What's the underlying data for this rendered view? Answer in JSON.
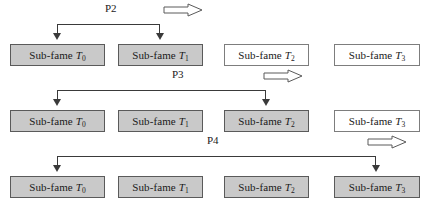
{
  "diagram": {
    "box_label_prefix": "Sub-fame",
    "colors": {
      "shaded_fill": "#c9c9c9",
      "plain_fill": "#ffffff",
      "border": "#4a4a4a",
      "line": "#3a3a3a",
      "text": "#1a1a1a"
    },
    "rows": [
      {
        "phase_label": "P2",
        "boxes": [
          {
            "name": "Sub-fame",
            "subscript": "0",
            "shaded": true
          },
          {
            "name": "Sub-fame",
            "subscript": "1",
            "shaded": true
          },
          {
            "name": "Sub-fame",
            "subscript": "2",
            "shaded": false
          },
          {
            "name": "Sub-fame",
            "subscript": "3",
            "shaded": false
          }
        ],
        "bracket_from": 0,
        "bracket_to": 1
      },
      {
        "phase_label": "P3",
        "boxes": [
          {
            "name": "Sub-fame",
            "subscript": "0",
            "shaded": true
          },
          {
            "name": "Sub-fame",
            "subscript": "1",
            "shaded": true
          },
          {
            "name": "Sub-fame",
            "subscript": "2",
            "shaded": true
          },
          {
            "name": "Sub-fame",
            "subscript": "3",
            "shaded": false
          }
        ],
        "bracket_from": 0,
        "bracket_to": 2
      },
      {
        "phase_label": "P4",
        "boxes": [
          {
            "name": "Sub-fame",
            "subscript": "0",
            "shaded": true
          },
          {
            "name": "Sub-fame",
            "subscript": "1",
            "shaded": true
          },
          {
            "name": "Sub-fame",
            "subscript": "2",
            "shaded": true
          },
          {
            "name": "Sub-fame",
            "subscript": "3",
            "shaded": true
          }
        ],
        "bracket_from": 0,
        "bracket_to": 3
      }
    ],
    "block_arrow_icon": "right-block-arrow-icon"
  }
}
